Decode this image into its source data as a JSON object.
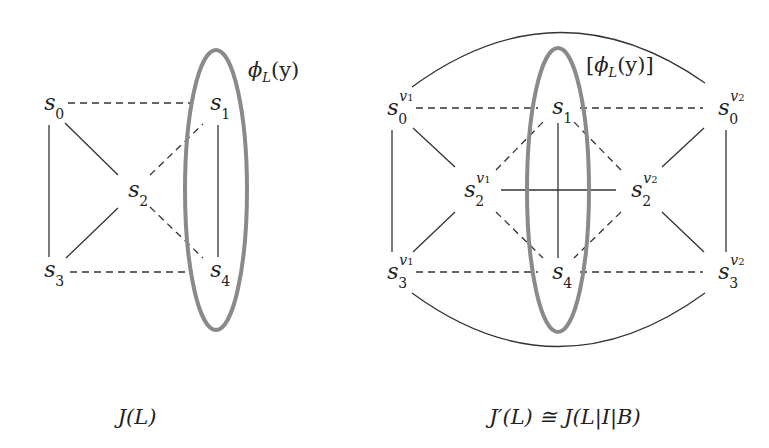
{
  "colors": {
    "edge": "#333333",
    "ellipse": "#8a8a8a",
    "text": "#222222"
  },
  "left_graph": {
    "caption": "J(L)",
    "ellipse_label": "ϕL(y)",
    "ellipse_label_parts": {
      "phi": "ϕ",
      "sub": "L",
      "arg": "(y)"
    },
    "nodes": [
      {
        "id": "s0",
        "base": "s",
        "sub": "0",
        "x": 48,
        "y": 103
      },
      {
        "id": "s1",
        "base": "s",
        "sub": "1",
        "x": 216,
        "y": 103
      },
      {
        "id": "s2",
        "base": "s",
        "sub": "2",
        "x": 135,
        "y": 190
      },
      {
        "id": "s3",
        "base": "s",
        "sub": "3",
        "x": 48,
        "y": 270
      },
      {
        "id": "s4",
        "base": "s",
        "sub": "4",
        "x": 216,
        "y": 270
      }
    ],
    "edges": [
      {
        "from": "s0",
        "to": "s1",
        "style": "dashed"
      },
      {
        "from": "s3",
        "to": "s4",
        "style": "dashed"
      },
      {
        "from": "s0",
        "to": "s3",
        "style": "solid"
      },
      {
        "from": "s1",
        "to": "s4",
        "style": "solid"
      },
      {
        "from": "s0",
        "to": "s2",
        "style": "solid"
      },
      {
        "from": "s3",
        "to": "s2",
        "style": "solid"
      },
      {
        "from": "s2",
        "to": "s1",
        "style": "dashed"
      },
      {
        "from": "s2",
        "to": "s4",
        "style": "dashed"
      }
    ]
  },
  "right_graph": {
    "caption": "J′(L) ≅ J(L|I|B)",
    "ellipse_label": "[ϕL(y)]",
    "ellipse_label_parts": {
      "open": "[",
      "phi": "ϕ",
      "sub": "L",
      "arg": "(y)",
      "close": "]"
    },
    "nodes": [
      {
        "id": "s0v1",
        "base": "s",
        "sub": "0",
        "sup": "v",
        "supsub": "1",
        "x": 392,
        "y": 108
      },
      {
        "id": "s1",
        "base": "s",
        "sub": "1",
        "x": 560,
        "y": 107
      },
      {
        "id": "s0v2",
        "base": "s",
        "sub": "0",
        "sup": "v",
        "supsub": "2",
        "x": 725,
        "y": 108
      },
      {
        "id": "s2v1",
        "base": "s",
        "sub": "2",
        "sup": "v",
        "supsub": "1",
        "x": 468,
        "y": 190
      },
      {
        "id": "s2v2",
        "base": "s",
        "sub": "2",
        "sup": "v",
        "supsub": "2",
        "x": 638,
        "y": 190
      },
      {
        "id": "s3v1",
        "base": "s",
        "sub": "3",
        "sup": "v",
        "supsub": "1",
        "x": 392,
        "y": 272
      },
      {
        "id": "s4",
        "base": "s",
        "sub": "4",
        "x": 560,
        "y": 272
      },
      {
        "id": "s3v2",
        "base": "s",
        "sub": "3",
        "sup": "v",
        "supsub": "2",
        "x": 725,
        "y": 272
      }
    ],
    "edges": [
      {
        "from": "s0v1",
        "to": "s1",
        "style": "dashed"
      },
      {
        "from": "s1",
        "to": "s0v2",
        "style": "dashed"
      },
      {
        "from": "s3v1",
        "to": "s4",
        "style": "dashed"
      },
      {
        "from": "s4",
        "to": "s3v2",
        "style": "dashed"
      },
      {
        "from": "s0v1",
        "to": "s3v1",
        "style": "solid"
      },
      {
        "from": "s0v2",
        "to": "s3v2",
        "style": "solid"
      },
      {
        "from": "s1",
        "to": "s4",
        "style": "solid"
      },
      {
        "from": "s2v1",
        "to": "s2v2",
        "style": "solid"
      },
      {
        "from": "s0v1",
        "to": "s2v1",
        "style": "solid"
      },
      {
        "from": "s3v1",
        "to": "s2v1",
        "style": "solid"
      },
      {
        "from": "s0v2",
        "to": "s2v2",
        "style": "solid"
      },
      {
        "from": "s3v2",
        "to": "s2v2",
        "style": "solid"
      },
      {
        "from": "s2v1",
        "to": "s1",
        "style": "dashed"
      },
      {
        "from": "s2v1",
        "to": "s4",
        "style": "dashed"
      },
      {
        "from": "s2v2",
        "to": "s1",
        "style": "dashed"
      },
      {
        "from": "s2v2",
        "to": "s4",
        "style": "dashed"
      },
      {
        "from": "s0v1",
        "to": "s0v2",
        "style": "arc-top"
      },
      {
        "from": "s3v1",
        "to": "s3v2",
        "style": "arc-bottom"
      }
    ]
  }
}
